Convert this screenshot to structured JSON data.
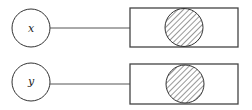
{
  "diagram": {
    "title": "",
    "rows": [
      {
        "input_label": "x",
        "input_shape": "circle",
        "target_shape": "rectangle",
        "target_content": "hatched-circle"
      },
      {
        "input_label": "y",
        "input_shape": "circle",
        "target_shape": "rectangle",
        "target_content": "hatched-circle"
      }
    ],
    "colors": {
      "stroke": "#333333",
      "background": "#ffffff",
      "hatch": "#333333"
    }
  }
}
